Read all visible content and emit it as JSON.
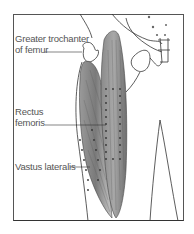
{
  "figure": {
    "type": "anatomical illustration",
    "labels": [
      {
        "id": "greater-trochanter",
        "line1": "Greater trochanter",
        "line2": "of femur"
      },
      {
        "id": "rectus-femoris",
        "line1": "Rectus",
        "line2": "femoris"
      },
      {
        "id": "vastus-lateralis",
        "line1": "Vastus lateralis"
      }
    ],
    "colors": {
      "frame": "#555555",
      "muscle_dark": "#6b6b6b",
      "muscle_light": "#bdbdbd",
      "outline": "#333333",
      "text": "#555555"
    }
  }
}
